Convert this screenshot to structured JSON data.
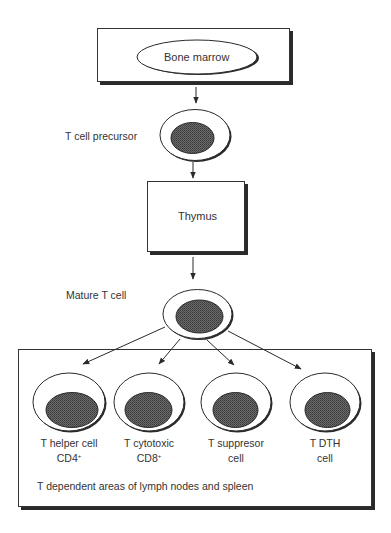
{
  "diagram": {
    "nodes": {
      "bone_marrow": {
        "label": "Bone marrow"
      },
      "t_cell_precursor": {
        "label": "T cell precursor"
      },
      "thymus": {
        "label": "Thymus"
      },
      "mature_t_cell": {
        "label": "Mature T cell"
      }
    },
    "subtypes": [
      {
        "line1": "T helper cell",
        "line2": "CD4",
        "sup": "+"
      },
      {
        "line1": "T cytotoxic",
        "line2": "CD8",
        "sup": "+"
      },
      {
        "line1": "T suppresor",
        "line2": "cell",
        "sup": ""
      },
      {
        "line1": "T DTH",
        "line2": "cell",
        "sup": ""
      }
    ],
    "region_caption": "T dependent areas of lymph nodes and spleen",
    "colors": {
      "line": "#2a2a2a",
      "nucleus": "#555555",
      "shadow": "#2a2a2a",
      "background": "#ffffff"
    }
  }
}
